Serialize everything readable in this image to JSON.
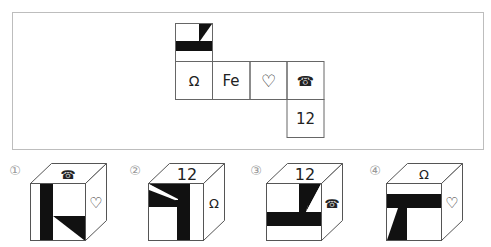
{
  "question": {
    "net": {
      "cells": [
        {
          "id": "top",
          "content": "pattern",
          "pattern": "black horizontal bar with slanted black block in upper right"
        },
        {
          "id": "row1",
          "content": "Ω"
        },
        {
          "id": "row2",
          "content": "Fe"
        },
        {
          "id": "row3",
          "content": "♡"
        },
        {
          "id": "row4",
          "content": "☎"
        },
        {
          "id": "bottom",
          "content": "12"
        }
      ]
    }
  },
  "options": [
    {
      "label": "①",
      "top": "☎",
      "right": "♡",
      "front": "pattern"
    },
    {
      "label": "②",
      "top": "12",
      "right": "Ω",
      "front": "pattern"
    },
    {
      "label": "③",
      "top": "12",
      "right": "☎",
      "front": "pattern"
    },
    {
      "label": "④",
      "top": "Ω",
      "right": "♡",
      "front": "pattern"
    }
  ],
  "colors": {
    "border": "#bbbbbb",
    "ink": "#111111",
    "line": "#555555"
  }
}
